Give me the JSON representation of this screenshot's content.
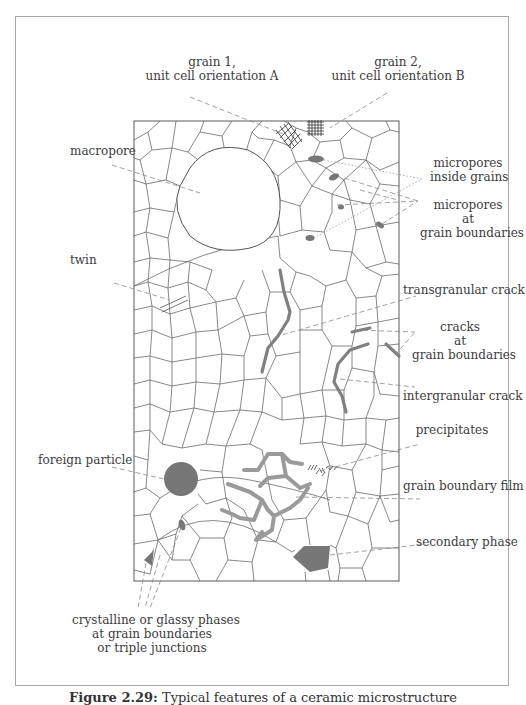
{
  "figure": {
    "caption_number": "Figure 2.29:",
    "caption_text": "Typical features of a ceramic microstructure",
    "colors": {
      "grain_boundary": "#6a6a6a",
      "feature_fill": "#777777",
      "crack": "#808080",
      "film": "#9a9a9a",
      "leader_line": "#8a8a8a",
      "frame": "#a8a8a8"
    }
  },
  "labels": {
    "grain1": [
      "grain 1,",
      "unit cell orientation A"
    ],
    "grain2": [
      "grain 2,",
      "unit cell orientation B"
    ],
    "macropore": "macropore",
    "micropores_inside": [
      "micropores",
      "inside grains"
    ],
    "micropores_boundaries": [
      "micropores",
      "at",
      "grain boundaries"
    ],
    "twin": "twin",
    "transgranular_crack": "transgranular crack",
    "cracks_boundaries": [
      "cracks",
      "at",
      "grain boundaries"
    ],
    "intergranular_crack": "intergranular crack",
    "precipitates": "precipitates",
    "foreign_particle": "foreign particle",
    "grain_boundary_film": "grain boundary film",
    "secondary_phase": "secondary phase",
    "glassy_phases": [
      "crystalline or glassy phases",
      "at grain boundaries",
      "or triple junctions"
    ]
  }
}
